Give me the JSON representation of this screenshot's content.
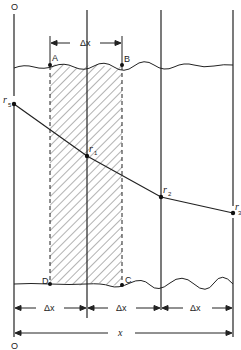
{
  "figure": {
    "origin_top_label": "O",
    "origin_bottom_label": "O",
    "top_interval_label": "Δx",
    "bottom_interval_labels": [
      "Δx",
      "Δx",
      "Δx"
    ],
    "total_length_label": "x",
    "corner_labels": {
      "A": "A",
      "B": "B",
      "C": "C",
      "D": "D"
    },
    "nodes": [
      {
        "symbol": "r",
        "subscript": "5",
        "x": 14,
        "y": 104
      },
      {
        "symbol": "r",
        "subscript": "1",
        "x": 87,
        "y": 156
      },
      {
        "symbol": "r",
        "subscript": "2",
        "x": 161,
        "y": 197
      },
      {
        "symbol": "r",
        "subscript": "3",
        "x": 233,
        "y": 213
      }
    ],
    "vertical_lines_x": [
      14,
      87,
      161,
      233
    ],
    "dashed_lines_x": [
      50,
      122
    ],
    "top_boundary_y": 66,
    "bottom_boundary_y": 284,
    "line_color": "#222222",
    "hatch_color": "#555555"
  }
}
